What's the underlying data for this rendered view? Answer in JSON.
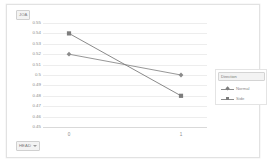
{
  "chart": {
    "value_field_button": {
      "label": "JOA",
      "arrow_icon": "chevron-down-icon"
    },
    "row_field_button": {
      "label": "HEAD",
      "arrow_icon": "chevron-down-icon"
    },
    "legend": {
      "field_label": "Direction",
      "arrow_icon": "chevron-down-icon",
      "entries": [
        {
          "label": "Normal",
          "marker": "diamond",
          "color": "#8b8b8b"
        },
        {
          "label": "Side",
          "marker": "square",
          "color": "#7d7d7d"
        }
      ]
    }
  },
  "chart_data": {
    "type": "line",
    "title": "",
    "xlabel": "",
    "ylabel": "JOA",
    "x": [
      0,
      1
    ],
    "categories": [
      "0",
      "1"
    ],
    "series": [
      {
        "name": "Normal",
        "values": [
          0.52,
          0.5
        ],
        "marker": "diamond",
        "color": "#8b8b8b"
      },
      {
        "name": "Side",
        "values": [
          0.54,
          0.48
        ],
        "marker": "square",
        "color": "#7d7d7d"
      }
    ],
    "ylim": [
      0.45,
      0.55
    ],
    "yticks": [
      0.55,
      0.54,
      0.53,
      0.52,
      0.51,
      0.5,
      0.49,
      0.48,
      0.47,
      0.46,
      0.45
    ],
    "ytick_labels": [
      "0.55",
      "0.54",
      "0.53",
      "0.52",
      "0.51",
      "0.5",
      "0.49",
      "0.48",
      "0.47",
      "0.46",
      "0.45"
    ],
    "xtick_labels": [
      "0",
      "1"
    ],
    "grid": true,
    "legend_position": "right",
    "plot_background": "#ffffff",
    "gridline_color": "#ededed"
  }
}
